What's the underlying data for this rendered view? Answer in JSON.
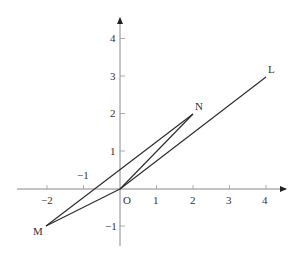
{
  "diagram": {
    "type": "coordinate-plane-geometry",
    "axes": {
      "x_ticks": [
        {
          "value": -2,
          "label": "−2"
        },
        {
          "value": -1,
          "label": "−1"
        },
        {
          "value": 1,
          "label": "1"
        },
        {
          "value": 2,
          "label": "2"
        },
        {
          "value": 3,
          "label": "3"
        },
        {
          "value": 4,
          "label": "4"
        }
      ],
      "y_ticks": [
        {
          "value": 4,
          "label": "4"
        },
        {
          "value": 3,
          "label": "3"
        },
        {
          "value": 2,
          "label": "2"
        },
        {
          "value": 1,
          "label": "1"
        },
        {
          "value": -1,
          "label": "−1"
        }
      ],
      "origin_label": "O",
      "xlim": [
        -2.8,
        4.5
      ],
      "ylim": [
        -1.5,
        4.5
      ]
    },
    "points": [
      {
        "name": "N",
        "x": 2,
        "y": 2,
        "label": "N"
      },
      {
        "name": "L",
        "x": 4,
        "y": 3,
        "label": "L"
      },
      {
        "name": "M",
        "x": -2,
        "y": -1,
        "label": "M"
      },
      {
        "name": "O",
        "x": 0,
        "y": 0,
        "label": "O"
      }
    ],
    "segments": [
      {
        "from": "O",
        "to": "L"
      },
      {
        "from": "O",
        "to": "N"
      },
      {
        "from": "M",
        "to": "N"
      },
      {
        "from": "M",
        "to": "O"
      }
    ],
    "colors": {
      "axis": "#888888",
      "line": "#2a2a2a",
      "text": "#333333"
    }
  }
}
